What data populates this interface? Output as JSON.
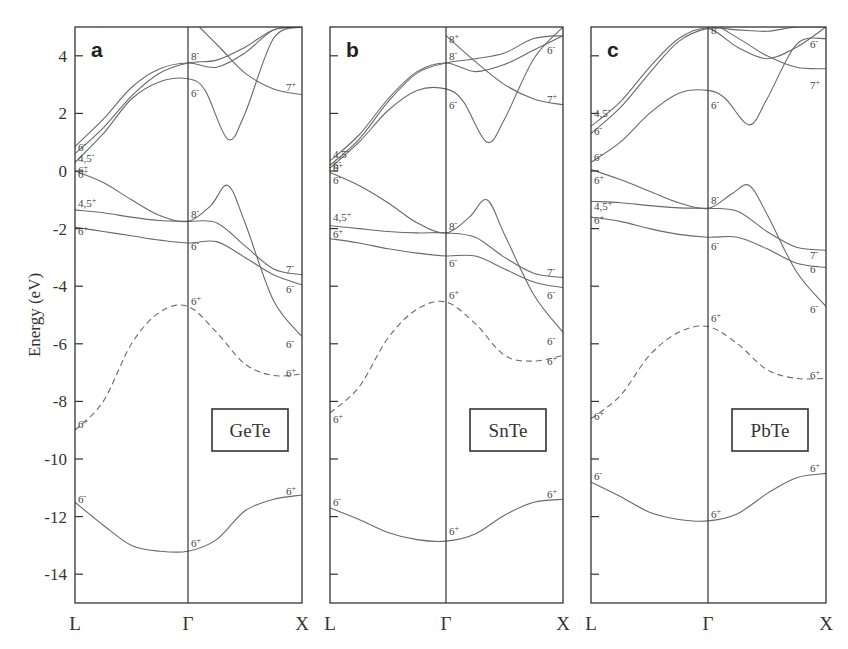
{
  "figure": {
    "ylabel": "Energy (eV)",
    "yticks": [
      "4",
      "2",
      "0",
      "-2",
      "-4",
      "-6",
      "-8",
      "-10",
      "-12",
      "-14"
    ],
    "ytick_values": [
      4,
      2,
      0,
      -2,
      -4,
      -6,
      -8,
      -10,
      -12,
      -14
    ],
    "k_labels": [
      "L",
      "Γ",
      "X"
    ]
  },
  "chart_data": [
    {
      "type": "line",
      "panel": "a",
      "title": "GeTe",
      "xlabel": "k-path (L – Γ – X)",
      "ylabel": "Energy (eV)",
      "ylim": [
        -15,
        5
      ],
      "x_ticks": [
        "L",
        "Γ",
        "X"
      ],
      "grid": false,
      "series": [
        {
          "name": "6- (low s band)",
          "style": "solid",
          "x": [
            0,
            0.25,
            0.5,
            0.75,
            1,
            1.25,
            1.5,
            1.75,
            2
          ],
          "values": [
            -11.5,
            -12.3,
            -13.0,
            -13.2,
            -13.2,
            -12.8,
            -11.8,
            -11.4,
            -11.25
          ]
        },
        {
          "name": "6+ (dashed)",
          "style": "dashed",
          "x": [
            0,
            0.25,
            0.5,
            0.75,
            1,
            1.25,
            1.5,
            1.75,
            2
          ],
          "values": [
            -9.0,
            -8.0,
            -6.0,
            -4.9,
            -4.7,
            -5.6,
            -6.7,
            -7.1,
            -7.05
          ]
        },
        {
          "name": "6+ / 6- (valence)",
          "style": "solid",
          "x": [
            0,
            0.25,
            0.5,
            0.75,
            1,
            1.25,
            1.5,
            1.75,
            2
          ],
          "values": [
            -1.95,
            -2.1,
            -2.25,
            -2.4,
            -2.5,
            -2.45,
            -3.0,
            -3.6,
            -3.95
          ]
        },
        {
          "name": "4,5+ / 7-",
          "style": "solid",
          "x": [
            0,
            0.25,
            0.5,
            0.75,
            1,
            1.25,
            1.5,
            1.75,
            2
          ],
          "values": [
            -1.35,
            -1.45,
            -1.6,
            -1.72,
            -1.75,
            -1.8,
            -2.6,
            -3.4,
            -3.6
          ]
        },
        {
          "name": "6+ (top valence) / 8-",
          "style": "solid",
          "x": [
            0,
            0.25,
            0.5,
            0.75,
            1,
            1.2,
            1.35,
            1.5,
            1.75,
            2
          ],
          "values": [
            0.0,
            -0.4,
            -1.0,
            -1.55,
            -1.75,
            -1.2,
            -0.5,
            -1.8,
            -4.5,
            -5.75
          ]
        },
        {
          "name": "6- (conduction) / 6-",
          "style": "solid",
          "x": [
            0,
            0.25,
            0.5,
            0.75,
            1,
            1.15,
            1.35,
            1.5,
            1.75,
            2
          ],
          "values": [
            0.3,
            1.3,
            2.5,
            3.1,
            3.2,
            2.8,
            1.1,
            2.0,
            4.6,
            5.0
          ]
        },
        {
          "name": "4,5- / 8-",
          "style": "solid",
          "x": [
            0,
            0.25,
            0.5,
            0.75,
            1,
            1.25,
            1.5,
            1.75,
            2
          ],
          "values": [
            0.6,
            1.5,
            2.6,
            3.4,
            3.75,
            3.85,
            4.3,
            4.9,
            5.0
          ]
        },
        {
          "name": "6- / 8-",
          "style": "solid",
          "x": [
            0,
            0.25,
            0.5,
            0.75,
            1,
            1.25,
            1.5,
            1.75,
            2
          ],
          "values": [
            0.85,
            1.8,
            2.9,
            3.55,
            3.75,
            3.6,
            4.1,
            4.9,
            5.0
          ]
        },
        {
          "name": "7+",
          "style": "solid",
          "x": [
            1.1,
            1.3,
            1.5,
            1.75,
            2
          ],
          "values": [
            5.0,
            4.2,
            3.4,
            2.85,
            2.65
          ]
        }
      ],
      "symmetry_labels": [
        {
          "text": "6-",
          "k": "L",
          "E": -11.4
        },
        {
          "text": "6+",
          "k": "Γ",
          "E": -12.9
        },
        {
          "text": "6+",
          "k": "X",
          "E": -11.1
        },
        {
          "text": "6+",
          "k": "L",
          "E": -8.8
        },
        {
          "text": "6+",
          "k": "Γ",
          "E": -4.5
        },
        {
          "text": "6-",
          "k": "X",
          "E": -6.0
        },
        {
          "text": "6+",
          "k": "X",
          "E": -7.0
        },
        {
          "text": "6+",
          "k": "L",
          "E": -2.1
        },
        {
          "text": "4,5+",
          "k": "L",
          "E": -1.1
        },
        {
          "text": "6+",
          "k": "L",
          "E": -0.1
        },
        {
          "text": "6+",
          "k": "L",
          "E": 0.05
        },
        {
          "text": "4,5-",
          "k": "L",
          "E": 0.45
        },
        {
          "text": "6-",
          "k": "L",
          "E": 0.85
        },
        {
          "text": "8-",
          "k": "Γ",
          "E": 4.0
        },
        {
          "text": "6-",
          "k": "Γ",
          "E": 2.7
        },
        {
          "text": "8-",
          "k": "Γ",
          "E": -1.5
        },
        {
          "text": "6-",
          "k": "Γ",
          "E": -2.6
        },
        {
          "text": "7+",
          "k": "X",
          "E": 2.9
        },
        {
          "text": "7-",
          "k": "X",
          "E": -3.4
        },
        {
          "text": "6-",
          "k": "X",
          "E": -4.1
        }
      ]
    },
    {
      "type": "line",
      "panel": "b",
      "title": "SnTe",
      "xlabel": "k-path (L – Γ – X)",
      "ylabel": "Energy (eV)",
      "ylim": [
        -15,
        5
      ],
      "x_ticks": [
        "L",
        "Γ",
        "X"
      ],
      "grid": false,
      "series": [
        {
          "name": "6- (low s band)",
          "style": "solid",
          "x": [
            0,
            0.25,
            0.5,
            0.75,
            1,
            1.25,
            1.5,
            1.75,
            2
          ],
          "values": [
            -11.7,
            -12.1,
            -12.55,
            -12.8,
            -12.85,
            -12.6,
            -11.95,
            -11.5,
            -11.4
          ]
        },
        {
          "name": "6+ (dashed)",
          "style": "dashed",
          "x": [
            0,
            0.25,
            0.5,
            0.75,
            1,
            1.25,
            1.5,
            1.75,
            2
          ],
          "values": [
            -8.4,
            -7.5,
            -5.8,
            -4.8,
            -4.55,
            -5.3,
            -6.4,
            -6.6,
            -6.4
          ]
        },
        {
          "name": "6+ / 6-",
          "style": "solid",
          "x": [
            0,
            0.25,
            0.5,
            0.75,
            1,
            1.25,
            1.5,
            1.75,
            2
          ],
          "values": [
            -2.35,
            -2.5,
            -2.7,
            -2.85,
            -2.95,
            -2.95,
            -3.4,
            -3.85,
            -4.05
          ]
        },
        {
          "name": "4,5+ / 7-",
          "style": "solid",
          "x": [
            0,
            0.25,
            0.5,
            0.75,
            1,
            1.25,
            1.5,
            1.75,
            2
          ],
          "values": [
            -1.9,
            -2.0,
            -2.1,
            -2.15,
            -2.15,
            -2.3,
            -3.0,
            -3.55,
            -3.7
          ]
        },
        {
          "name": "6- (top valence) / 8-",
          "style": "solid",
          "x": [
            0,
            0.25,
            0.5,
            0.75,
            1,
            1.2,
            1.35,
            1.5,
            1.75,
            2
          ],
          "values": [
            -0.05,
            -0.5,
            -1.1,
            -1.8,
            -2.15,
            -1.6,
            -1.0,
            -2.2,
            -4.3,
            -5.6
          ]
        },
        {
          "name": "6- (conduction) / 6-",
          "style": "solid",
          "x": [
            0,
            0.25,
            0.5,
            0.75,
            1,
            1.15,
            1.35,
            1.5,
            1.75,
            2
          ],
          "values": [
            0.1,
            1.0,
            2.1,
            2.8,
            2.85,
            2.4,
            1.0,
            1.8,
            3.9,
            5.0
          ]
        },
        {
          "name": "6+ / 8-",
          "style": "solid",
          "x": [
            0,
            0.25,
            0.5,
            0.75,
            1,
            1.25,
            1.5,
            1.75,
            2
          ],
          "values": [
            0.2,
            1.1,
            2.4,
            3.4,
            3.75,
            3.9,
            4.1,
            4.6,
            4.7
          ]
        },
        {
          "name": "4,5- / 8+",
          "style": "solid",
          "x": [
            0,
            0.25,
            0.5,
            0.75,
            1,
            1.25,
            1.5,
            1.75,
            2
          ],
          "values": [
            0.35,
            1.25,
            2.5,
            3.45,
            3.75,
            3.45,
            3.7,
            4.2,
            4.7
          ]
        },
        {
          "name": "7+",
          "style": "solid",
          "x": [
            1,
            1.25,
            1.5,
            1.75,
            2
          ],
          "values": [
            4.7,
            3.8,
            3.0,
            2.5,
            2.3
          ]
        }
      ],
      "symmetry_labels": [
        {
          "text": "6-",
          "k": "L",
          "E": -11.5
        },
        {
          "text": "6+",
          "k": "Γ",
          "E": -12.5
        },
        {
          "text": "6+",
          "k": "X",
          "E": -11.2
        },
        {
          "text": "6+",
          "k": "L",
          "E": -8.6
        },
        {
          "text": "6+",
          "k": "Γ",
          "E": -4.3
        },
        {
          "text": "6-",
          "k": "X",
          "E": -5.9
        },
        {
          "text": "6+",
          "k": "X",
          "E": -6.6
        },
        {
          "text": "6+",
          "k": "L",
          "E": -2.2
        },
        {
          "text": "4,5+",
          "k": "L",
          "E": -1.6
        },
        {
          "text": "6-",
          "k": "L",
          "E": -0.3
        },
        {
          "text": "6+",
          "k": "L",
          "E": 0.1
        },
        {
          "text": "6-",
          "k": "L",
          "E": 0.2
        },
        {
          "text": "4,5-",
          "k": "L",
          "E": 0.6
        },
        {
          "text": "8+",
          "k": "Γ",
          "E": 4.6
        },
        {
          "text": "8-",
          "k": "Γ",
          "E": 4.0
        },
        {
          "text": "6-",
          "k": "Γ",
          "E": 2.3
        },
        {
          "text": "8-",
          "k": "Γ",
          "E": -1.9
        },
        {
          "text": "6-",
          "k": "Γ",
          "E": -3.2
        },
        {
          "text": "6-",
          "k": "X",
          "E": 4.2
        },
        {
          "text": "7+",
          "k": "X",
          "E": 2.5
        },
        {
          "text": "7-",
          "k": "X",
          "E": -3.5
        },
        {
          "text": "6-",
          "k": "X",
          "E": -4.3
        }
      ]
    },
    {
      "type": "line",
      "panel": "c",
      "title": "PbTe",
      "xlabel": "k-path (L – Γ – X)",
      "ylabel": "Energy (eV)",
      "ylim": [
        -15,
        5
      ],
      "x_ticks": [
        "L",
        "Γ",
        "X"
      ],
      "grid": false,
      "series": [
        {
          "name": "6- (low s band)",
          "style": "solid",
          "x": [
            0,
            0.25,
            0.5,
            0.75,
            1,
            1.25,
            1.5,
            1.75,
            2
          ],
          "values": [
            -10.8,
            -11.3,
            -11.85,
            -12.1,
            -12.15,
            -11.9,
            -11.2,
            -10.65,
            -10.5
          ]
        },
        {
          "name": "6+ (dashed)",
          "style": "dashed",
          "x": [
            0,
            0.25,
            0.5,
            0.75,
            1,
            1.25,
            1.5,
            1.75,
            2
          ],
          "values": [
            -8.6,
            -7.8,
            -6.4,
            -5.6,
            -5.4,
            -6.0,
            -6.9,
            -7.2,
            -7.2
          ]
        },
        {
          "name": "6+ / 6-",
          "style": "solid",
          "x": [
            0,
            0.25,
            0.5,
            0.75,
            1,
            1.25,
            1.5,
            1.75,
            2
          ],
          "values": [
            -1.6,
            -1.75,
            -2.0,
            -2.2,
            -2.3,
            -2.3,
            -2.7,
            -3.2,
            -3.35
          ]
        },
        {
          "name": "4,5+ / 7-",
          "style": "solid",
          "x": [
            0,
            0.25,
            0.5,
            0.75,
            1,
            1.25,
            1.5,
            1.75,
            2
          ],
          "values": [
            -1.05,
            -1.1,
            -1.2,
            -1.28,
            -1.3,
            -1.4,
            -2.1,
            -2.65,
            -2.75
          ]
        },
        {
          "name": "6+ (top valence) / 8-",
          "style": "solid",
          "x": [
            0,
            0.25,
            0.5,
            0.75,
            1,
            1.2,
            1.35,
            1.5,
            1.75,
            2
          ],
          "values": [
            0.05,
            -0.3,
            -0.7,
            -1.1,
            -1.3,
            -0.8,
            -0.5,
            -1.5,
            -3.5,
            -4.7
          ]
        },
        {
          "name": "6- (conduction) / 6-",
          "style": "solid",
          "x": [
            0,
            0.25,
            0.5,
            0.75,
            1,
            1.15,
            1.35,
            1.5,
            1.75,
            2
          ],
          "values": [
            0.3,
            1.0,
            2.0,
            2.7,
            2.8,
            2.5,
            1.6,
            2.5,
            4.4,
            4.6
          ]
        },
        {
          "name": "6- / 8-",
          "style": "solid",
          "x": [
            0,
            0.25,
            0.5,
            0.75,
            1,
            1.25,
            1.5,
            1.75,
            2
          ],
          "values": [
            1.3,
            2.2,
            3.4,
            4.5,
            4.95,
            4.9,
            4.85,
            5.0,
            5.0
          ]
        },
        {
          "name": "4,5- / 8-",
          "style": "solid",
          "x": [
            0,
            0.25,
            0.5,
            0.75,
            1,
            1.25,
            1.5,
            1.75,
            2
          ],
          "values": [
            1.55,
            2.4,
            3.6,
            4.6,
            4.95,
            4.3,
            3.9,
            4.3,
            5.0
          ]
        },
        {
          "name": "7+",
          "style": "solid",
          "x": [
            1.1,
            1.3,
            1.5,
            1.75,
            2
          ],
          "values": [
            5.0,
            4.5,
            4.0,
            3.6,
            3.55
          ]
        }
      ],
      "symmetry_labels": [
        {
          "text": "6-",
          "k": "L",
          "E": -10.6
        },
        {
          "text": "6+",
          "k": "Γ",
          "E": -11.9
        },
        {
          "text": "6+",
          "k": "X",
          "E": -10.3
        },
        {
          "text": "6+",
          "k": "L",
          "E": -8.5
        },
        {
          "text": "6+",
          "k": "Γ",
          "E": -5.1
        },
        {
          "text": "6-",
          "k": "X",
          "E": -4.8
        },
        {
          "text": "6+",
          "k": "X",
          "E": -7.1
        },
        {
          "text": "6+",
          "k": "L",
          "E": -1.7
        },
        {
          "text": "4,5+",
          "k": "L",
          "E": -1.2
        },
        {
          "text": "6+",
          "k": "L",
          "E": -0.3
        },
        {
          "text": "6-",
          "k": "L",
          "E": 0.5
        },
        {
          "text": "6-",
          "k": "L",
          "E": 1.4
        },
        {
          "text": "4,5-",
          "k": "L",
          "E": 2.0
        },
        {
          "text": "8-",
          "k": "Γ",
          "E": 4.9
        },
        {
          "text": "6-",
          "k": "Γ",
          "E": 2.3
        },
        {
          "text": "8-",
          "k": "Γ",
          "E": -1.0
        },
        {
          "text": "6-",
          "k": "Γ",
          "E": -2.6
        },
        {
          "text": "6-",
          "k": "X",
          "E": 4.4
        },
        {
          "text": "7+",
          "k": "X",
          "E": 3.0
        },
        {
          "text": "7-",
          "k": "X",
          "E": -2.9
        },
        {
          "text": "6-",
          "k": "X",
          "E": -3.4
        }
      ]
    }
  ],
  "panels": [
    {
      "letter": "a",
      "material": "GeTe"
    },
    {
      "letter": "b",
      "material": "SnTe"
    },
    {
      "letter": "c",
      "material": "PbTe"
    }
  ]
}
